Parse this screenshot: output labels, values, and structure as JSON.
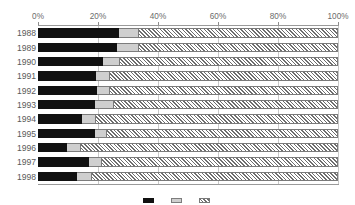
{
  "chart_data": {
    "type": "bar",
    "orientation": "horizontal",
    "stacked": true,
    "normalized": true,
    "title": "",
    "subtitle": "",
    "xlabel": "",
    "ylabel": "",
    "xlim": [
      0,
      100
    ],
    "grid": true,
    "grid_axis": "x",
    "legend_position": "bottom",
    "x_tick_labels": [
      "0%",
      "20%",
      "40%",
      "60%",
      "80%",
      "100%"
    ],
    "x_tick_values": [
      0,
      20,
      40,
      60,
      80,
      100
    ],
    "categories": [
      "1988",
      "1989",
      "1990",
      "1991",
      "1992",
      "1993",
      "1994",
      "1995",
      "1996",
      "1997",
      "1998"
    ],
    "series": [
      {
        "name": "series-1",
        "label": "",
        "fill": "solid-black",
        "color": "#111111",
        "values": [
          27.0,
          26.3,
          21.7,
          19.3,
          19.7,
          19.0,
          14.7,
          19.0,
          9.7,
          17.0,
          13.0
        ]
      },
      {
        "name": "series-2",
        "label": "",
        "fill": "solid-light-gray",
        "color": "#cfcfcf",
        "values": [
          6.3,
          7.0,
          5.3,
          4.3,
          4.0,
          6.0,
          4.3,
          3.7,
          4.3,
          4.0,
          4.7
        ]
      },
      {
        "name": "series-3",
        "label": "",
        "fill": "diagonal-hatch",
        "color": "#6e6e6e",
        "values": [
          66.7,
          66.7,
          73.0,
          76.4,
          76.3,
          75.0,
          81.0,
          77.3,
          86.0,
          79.0,
          82.3
        ]
      }
    ],
    "legend_entries": [
      {
        "label": "",
        "fill": "solid-black"
      },
      {
        "label": "",
        "fill": "solid-light-gray"
      },
      {
        "label": "",
        "fill": "diagonal-hatch"
      }
    ]
  },
  "colors": {
    "series_1": "#111111",
    "series_2": "#cfcfcf",
    "series_3_hatch": "#6e6e6e",
    "gridline": "#c8c8c8",
    "axis_line": "#9a9a9a",
    "tick_text": "#6b6b6b",
    "category_text": "#5a5a5a",
    "background": "#ffffff"
  }
}
